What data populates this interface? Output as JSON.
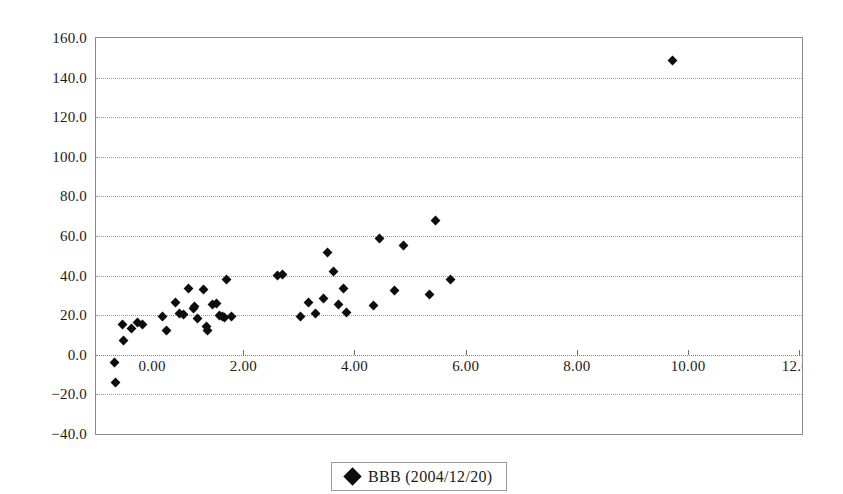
{
  "chart_data": {
    "type": "scatter",
    "title": "",
    "xlabel": "",
    "ylabel": "",
    "xlim": [
      -0.65,
      12.05
    ],
    "ylim": [
      -40.0,
      160.0
    ],
    "grid": true,
    "legend_position": "bottom-center",
    "y_ticks": [
      "160.0",
      "140.0",
      "120.0",
      "100.0",
      "80.0",
      "60.0",
      "40.0",
      "20.0",
      "0.0",
      "-20.0",
      "-40.0"
    ],
    "y_tick_values": [
      160.0,
      140.0,
      120.0,
      100.0,
      80.0,
      60.0,
      40.0,
      20.0,
      0.0,
      -20.0,
      -40.0
    ],
    "x_ticks": [
      "0.00",
      "2.00",
      "4.00",
      "6.00",
      "8.00",
      "10.00",
      "12.00"
    ],
    "x_tick_values": [
      0.0,
      2.0,
      4.0,
      6.0,
      8.0,
      10.0,
      12.0
    ],
    "marker_color": "#0d0d0d",
    "marker_shape": "diamond",
    "series": [
      {
        "name": "BBB (2004/12/20)",
        "points": [
          [
            -0.3,
            -14.0
          ],
          [
            -0.32,
            -4.0
          ],
          [
            -0.18,
            15.5
          ],
          [
            -0.15,
            7.0
          ],
          [
            -0.02,
            13.5
          ],
          [
            0.1,
            16.5
          ],
          [
            0.18,
            15.5
          ],
          [
            0.55,
            19.5
          ],
          [
            0.62,
            12.5
          ],
          [
            0.78,
            26.5
          ],
          [
            0.85,
            21.0
          ],
          [
            0.92,
            20.5
          ],
          [
            1.02,
            33.5
          ],
          [
            1.1,
            23.5
          ],
          [
            1.12,
            24.5
          ],
          [
            1.18,
            18.5
          ],
          [
            1.28,
            33.0
          ],
          [
            1.33,
            14.5
          ],
          [
            1.35,
            12.5
          ],
          [
            1.45,
            25.5
          ],
          [
            1.52,
            26.0
          ],
          [
            1.58,
            20.0
          ],
          [
            1.62,
            19.5
          ],
          [
            1.66,
            19.0
          ],
          [
            1.7,
            38.0
          ],
          [
            1.78,
            19.5
          ],
          [
            2.62,
            40.0
          ],
          [
            2.7,
            40.5
          ],
          [
            3.02,
            19.5
          ],
          [
            3.18,
            26.5
          ],
          [
            3.3,
            21.0
          ],
          [
            3.45,
            28.5
          ],
          [
            3.52,
            51.5
          ],
          [
            3.62,
            42.0
          ],
          [
            3.72,
            25.5
          ],
          [
            3.8,
            33.5
          ],
          [
            3.85,
            21.5
          ],
          [
            4.35,
            25.0
          ],
          [
            4.45,
            58.5
          ],
          [
            4.72,
            32.5
          ],
          [
            4.88,
            55.0
          ],
          [
            5.35,
            30.5
          ],
          [
            5.45,
            68.0
          ],
          [
            5.72,
            38.0
          ],
          [
            9.72,
            148.5
          ]
        ]
      }
    ]
  },
  "legend": {
    "marker": "diamond-marker",
    "label": "BBB (2004/12/20)"
  }
}
